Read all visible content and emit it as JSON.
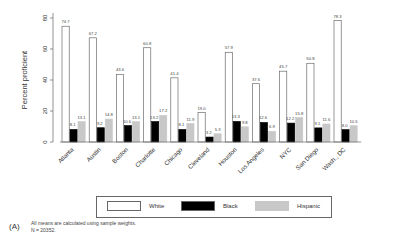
{
  "chart_data": {
    "type": "bar",
    "title": "",
    "xlabel": "",
    "ylabel": "Percent proficient",
    "ylim": [
      0,
      85
    ],
    "yticks": [
      0,
      20,
      40,
      60,
      80
    ],
    "grid": false,
    "legend_position": "bottom",
    "categories": [
      "Atlanta",
      "Austin",
      "Boston",
      "Charlotte",
      "Chicago",
      "Cleveland",
      "Houston",
      "Los Angeles",
      "NYC",
      "San Diego",
      "Wash., DC"
    ],
    "series": [
      {
        "name": "White",
        "color": "#ffffff",
        "values": [
          74.7,
          67.2,
          43.6,
          60.8,
          41.4,
          19.0,
          57.9,
          37.6,
          45.7,
          50.8,
          78.3
        ]
      },
      {
        "name": "Black",
        "color": "#000000",
        "values": [
          8.1,
          9.2,
          10.6,
          13.2,
          8.1,
          3.2,
          13.3,
          12.6,
          12.2,
          9.1,
          8.0
        ]
      },
      {
        "name": "Hispanic",
        "color": "#c8c8c8",
        "values": [
          13.1,
          14.8,
          13.1,
          17.2,
          11.9,
          5.3,
          9.8,
          6.9,
          15.8,
          11.6,
          10.5
        ]
      }
    ]
  },
  "legend": {
    "items": [
      {
        "label": "White",
        "color": "#ffffff"
      },
      {
        "label": "Black",
        "color": "#000000"
      },
      {
        "label": "Hispanic",
        "color": "#c8c8c8"
      }
    ]
  },
  "footnote": {
    "panel_label": "(A)",
    "line1": "All means are calculated using sample weights.",
    "line2": "N = 20352."
  }
}
